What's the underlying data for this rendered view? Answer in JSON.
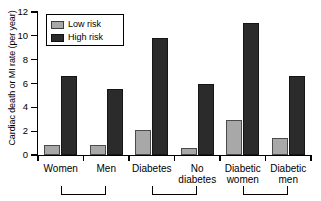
{
  "chart_data": {
    "type": "bar",
    "title": "",
    "xlabel": "",
    "ylabel": "Cardiac death or MI rate (per year)",
    "categories": [
      "Women",
      "Men",
      "Diabetes",
      "No diabetes",
      "Diabetic women",
      "Diabetic men"
    ],
    "series": [
      {
        "name": "Low risk",
        "color": "#a8a8a8",
        "values": [
          0.8,
          0.85,
          2.1,
          0.6,
          2.9,
          1.4
        ]
      },
      {
        "name": "High risk",
        "color": "#2b2b2b",
        "values": [
          6.6,
          5.5,
          9.8,
          6.0,
          11.1,
          6.6
        ]
      }
    ],
    "ylim": [
      0,
      12
    ],
    "yticks": [
      0,
      2,
      4,
      6,
      8,
      10,
      12
    ],
    "ytick_labels": [
      "0",
      "2",
      "4",
      "6",
      "8",
      "10",
      "12"
    ],
    "grid": false,
    "legend_position": "upper-left",
    "legend_entries": [
      "Low risk",
      "High risk"
    ],
    "annotations": {
      "brackets": [
        {
          "label": "",
          "from_category": "Women",
          "to_category": "Men"
        },
        {
          "label": "",
          "from_category": "Diabetes",
          "to_category": "No diabetes"
        },
        {
          "label": "",
          "from_category": "Diabetic women",
          "to_category": "Diabetic men"
        }
      ]
    }
  },
  "axis": {
    "y_title": "Cardiac death or MI rate (per year)"
  },
  "legend": {
    "items": [
      {
        "label": "Low risk"
      },
      {
        "label": "High risk"
      }
    ]
  },
  "categories": [
    {
      "line1": "Women",
      "line2": ""
    },
    {
      "line1": "Men",
      "line2": ""
    },
    {
      "line1": "Diabetes",
      "line2": ""
    },
    {
      "line1": "No",
      "line2": "diabetes"
    },
    {
      "line1": "Diabetic",
      "line2": "women"
    },
    {
      "line1": "Diabetic",
      "line2": "men"
    }
  ],
  "yticks": [
    {
      "label": "12"
    },
    {
      "label": "10"
    },
    {
      "label": "8"
    },
    {
      "label": "6"
    },
    {
      "label": "4"
    },
    {
      "label": "2"
    },
    {
      "label": "0"
    }
  ]
}
